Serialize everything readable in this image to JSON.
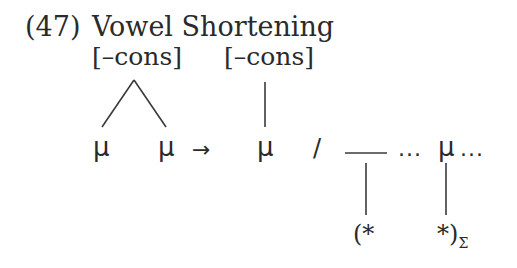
{
  "example": {
    "number": "(47)",
    "title": "Vowel Shortening"
  },
  "rule": {
    "input_feature": "[–cons]",
    "output_feature": "[–cons]",
    "input_moras": [
      "μ",
      "μ"
    ],
    "arrow": "→",
    "output_mora": "μ",
    "environment_slash": "/",
    "context": {
      "dots_before": "...",
      "mora": "μ",
      "dots_after": "...",
      "foot_open": "(*",
      "foot_close": "*)",
      "foot_subscript": "Σ"
    }
  }
}
